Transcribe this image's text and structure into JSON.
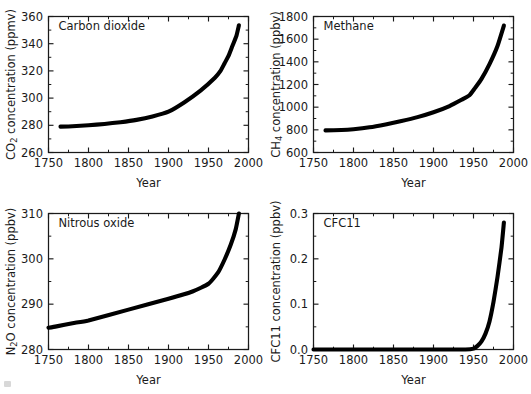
{
  "figure": {
    "panel_count": 4,
    "layout": "2x2"
  },
  "common": {
    "xlabel": "Year",
    "x_ticks": [
      "1750",
      "1800",
      "1850",
      "1900",
      "1950",
      "2000"
    ],
    "xlim": [
      1750,
      2000
    ],
    "x_minor_step": 25
  },
  "chart_data": [
    {
      "type": "line",
      "id": "carbon-dioxide",
      "title": "Carbon dioxide",
      "xlabel": "Year",
      "ylabel": "CO2 concentration (ppmv)",
      "ylabel_base": "CO",
      "ylabel_sub": "2",
      "ylabel_rest": " concentration (ppmv)",
      "xlim": [
        1750,
        2000
      ],
      "ylim": [
        260,
        360
      ],
      "y_ticks": [
        "260",
        "280",
        "300",
        "320",
        "340",
        "360"
      ],
      "y_minor_step": 10,
      "grid": false,
      "legend": "none",
      "x": [
        1765,
        1780,
        1800,
        1820,
        1840,
        1860,
        1880,
        1900,
        1920,
        1940,
        1958,
        1965,
        1970,
        1975,
        1980,
        1985,
        1988
      ],
      "values": [
        279.0,
        279.3,
        280.0,
        281.0,
        282.3,
        284.0,
        286.5,
        290.0,
        297.0,
        305.5,
        315.0,
        320.0,
        325.5,
        331.0,
        338.5,
        346.0,
        353.5
      ]
    },
    {
      "type": "line",
      "id": "methane",
      "title": "Methane",
      "xlabel": "Year",
      "ylabel": "CH4 concentration (ppbv)",
      "ylabel_base": "CH",
      "ylabel_sub": "4",
      "ylabel_rest": " concentration (ppbv)",
      "xlim": [
        1750,
        2000
      ],
      "ylim": [
        600,
        1800
      ],
      "y_ticks": [
        "600",
        "800",
        "1000",
        "1200",
        "1400",
        "1600",
        "1800"
      ],
      "y_minor_step": 100,
      "grid": false,
      "legend": "none",
      "x": [
        1765,
        1785,
        1800,
        1820,
        1840,
        1860,
        1880,
        1900,
        1920,
        1935,
        1945,
        1952,
        1960,
        1970,
        1980,
        1988
      ],
      "values": [
        795,
        798,
        805,
        822,
        848,
        878,
        912,
        955,
        1010,
        1065,
        1105,
        1170,
        1250,
        1380,
        1540,
        1720
      ]
    },
    {
      "type": "line",
      "id": "nitrous-oxide",
      "title": "Nitrous oxide",
      "xlabel": "Year",
      "ylabel": "N2O concentration (ppbv)",
      "ylabel_base": "N",
      "ylabel_sub": "2",
      "ylabel_rest": "O concentration (ppbv)",
      "xlim": [
        1750,
        2000
      ],
      "ylim": [
        280,
        310
      ],
      "y_ticks": [
        "280",
        "290",
        "300",
        "310"
      ],
      "y_minor_step": 5,
      "grid": false,
      "legend": "none",
      "x": [
        1750,
        1760,
        1780,
        1800,
        1850,
        1900,
        1930,
        1950,
        1962,
        1970,
        1978,
        1984,
        1988
      ],
      "values": [
        284.8,
        285.1,
        285.8,
        286.4,
        288.8,
        291.2,
        292.8,
        294.5,
        297.0,
        299.8,
        303.2,
        306.5,
        310.0
      ]
    },
    {
      "type": "line",
      "id": "cfc11",
      "title": "CFC11",
      "xlabel": "Year",
      "ylabel": "CFC11 concentration (ppbv)",
      "ylabel_base": "CFC11 concentration (ppbv)",
      "ylabel_sub": "",
      "ylabel_rest": "",
      "xlim": [
        1750,
        2000
      ],
      "ylim": [
        0.0,
        0.3
      ],
      "y_ticks": [
        "0.0",
        "0.1",
        "0.2",
        "0.3"
      ],
      "y_minor_step": 0.05,
      "grid": false,
      "legend": "none",
      "x": [
        1750,
        1900,
        1940,
        1950,
        1955,
        1960,
        1965,
        1970,
        1975,
        1980,
        1985,
        1988
      ],
      "values": [
        0.0,
        0.0,
        0.0,
        0.002,
        0.008,
        0.018,
        0.035,
        0.062,
        0.105,
        0.16,
        0.225,
        0.28
      ]
    }
  ],
  "colors": {
    "curve": "#000000",
    "axis": "#1a1a1a",
    "background": "#ffffff"
  }
}
